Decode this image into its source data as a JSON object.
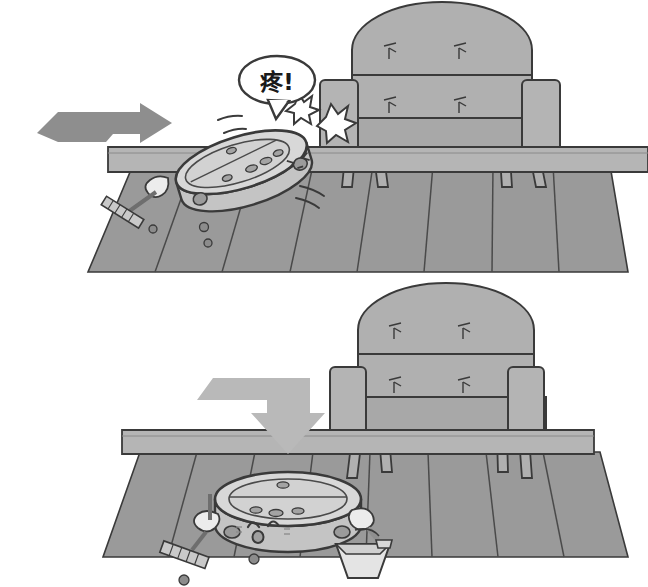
{
  "illustration": {
    "title": "Robot vacuum stuck under sofa",
    "panel_count": 2,
    "style": "grayscale line-art cartoon",
    "colors": {
      "background": "#ffffff",
      "outline": "#3a3a3a",
      "floor": "#9a9a9a",
      "floor_line": "#4a4a4a",
      "sofa": "#b0b0b0",
      "sofa_dark": "#a0a0a0",
      "baseboard": "#b5b5b5",
      "robot_top": "#d8d8d8",
      "robot_body": "#c4c4c4",
      "robot_side": "#b8b8b8",
      "arrow_top": "#8e8e8e",
      "arrow_bottom": "#b9b9b9",
      "star_fill": "#ffffff",
      "bubble_fill": "#ffffff",
      "text": "#1a1a1a"
    }
  },
  "panels": [
    {
      "id": "panel-top",
      "name": "collision-panel",
      "caption": "Robot vacuum hits the sofa baseboard and tilts",
      "speech_bubble": {
        "text": "疼!",
        "meaning": "Ouch!",
        "shape": "oval"
      },
      "motion_arrow": {
        "direction": "right",
        "color": "#8e8e8e",
        "label": "forward-motion-arrow"
      },
      "robot": {
        "name": "robot-vacuum",
        "state": "tilted",
        "face": ">_<",
        "face_expression": "pain",
        "sensor_dots": 5,
        "accessories": [
          "broom",
          "gloved-hand"
        ]
      },
      "impact_stars": 2,
      "motion_lines": 2,
      "sofa": {
        "name": "sofa",
        "tufting_marks": 4,
        "legs": 4,
        "arms": 2
      },
      "floor": {
        "name": "wood-floor",
        "plank_count": 8
      },
      "dirt_specks": 3
    },
    {
      "id": "panel-bottom",
      "name": "stuck-panel",
      "caption": "Robot vacuum sits sad beneath the sofa baseboard",
      "motion_arrow": {
        "direction": "down",
        "color": "#b9b9b9",
        "label": "downward-pressure-arrow"
      },
      "robot": {
        "name": "robot-vacuum",
        "state": "upright",
        "face": "sad",
        "face_expression": "worried",
        "sensor_dots": 4,
        "accessories": [
          "broom",
          "dustpan",
          "gloved-hands"
        ]
      },
      "sofa": {
        "name": "sofa",
        "tufting_marks": 4,
        "legs": 4,
        "arms": 2
      },
      "floor": {
        "name": "wood-floor",
        "plank_count": 8
      },
      "dirt_specks": 2
    }
  ]
}
